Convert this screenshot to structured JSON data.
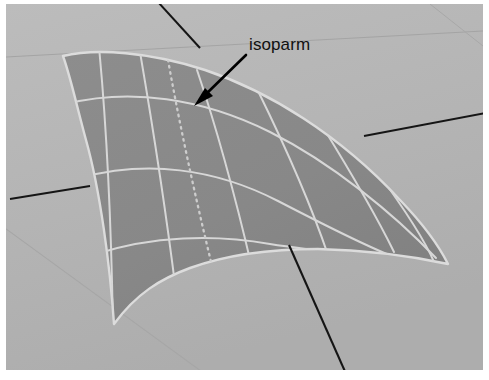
{
  "figure": {
    "kind": "3d-surface-viewport",
    "canvas": {
      "width": 489,
      "height": 380
    }
  },
  "colors": {
    "page_background": "#ffffff",
    "viewport_background": "#b5b5b5",
    "viewport_background_shade": "#aeaeae",
    "surface_fill": "#8a8a8a",
    "surface_fill_shade": "#828282",
    "surface_outline": "#d8d8d8",
    "isoparm_grid_line": "#d9d9d9",
    "isoparm_highlight_dotted": "#c9c9c9",
    "axis_line": "#141414",
    "ground_grid_line": "#a2a2a2",
    "annotation_text": "#111111",
    "annotation_arrow": "#000000"
  },
  "annotations": [
    {
      "id": "isoparm-callout",
      "label": "isoparm",
      "label_x": 249,
      "label_y": 36,
      "arrow_from": [
        246,
        55
      ],
      "arrow_to": [
        196,
        104
      ]
    }
  ],
  "viewport": {
    "background_rect": {
      "x": 6,
      "y": 4,
      "width": 477,
      "height": 366
    },
    "ground_grid_lines": [
      {
        "name": "ground-grid-horizontal",
        "x1": 6,
        "y1": 56,
        "x2": 483,
        "y2": 30
      },
      {
        "name": "ground-grid-diagonal-left",
        "x1": 6,
        "y1": 230,
        "x2": 200,
        "y2": 370
      }
    ],
    "axes": [
      {
        "name": "axis-vertical-blue",
        "points": "160,4 264,118 289,255 340,370",
        "visible_segments": [
          {
            "x1": 160,
            "y1": 4,
            "x2": 196,
            "y2": 44
          },
          {
            "x1": 291,
            "y1": 247,
            "x2": 344,
            "y2": 370
          }
        ]
      },
      {
        "name": "axis-horizontal-right",
        "visible_segments": [
          {
            "x1": 366,
            "y1": 135,
            "x2": 483,
            "y2": 113
          }
        ]
      },
      {
        "name": "axis-horizontal-left",
        "visible_segments": [
          {
            "x1": 12,
            "y1": 198,
            "x2": 88,
            "y2": 186
          }
        ]
      }
    ]
  },
  "surface": {
    "name": "nurbs-surface-patch",
    "outline_path": "M 63,56 C 96,48 150,52 205,70 C 268,91 340,135 400,200 C 425,226 440,248 448,264 C 420,258 370,250 318,249 C 270,249 226,255 190,268 C 160,279 136,294 114,324 C 110,265 100,190 86,140 C 76,103 70,75 63,56 Z",
    "u_isoparms": [
      {
        "name": "u-iso-1",
        "path": "M 100,50 C 106,110 112,200 114,324"
      },
      {
        "name": "u-iso-2",
        "path": "M 140,53 C 152,120 166,210 175,285"
      },
      {
        "name": "u-iso-3",
        "path": "M 196,71 C 216,130 236,205 250,262"
      },
      {
        "name": "u-iso-4",
        "path": "M 258,94 C 284,146 310,205 326,249"
      },
      {
        "name": "u-iso-5",
        "path": "M 320,125 C 349,170 376,215 392,246"
      },
      {
        "name": "u-iso-6",
        "path": "M 375,171 C 398,202 422,236 432,256"
      }
    ],
    "v_isoparms": [
      {
        "name": "v-iso-1",
        "path": "M 72,110 C 130,92 200,100 268,133 C 330,163 392,214 432,256"
      },
      {
        "name": "v-iso-2",
        "path": "M 84,180 C 146,162 212,170 276,202 C 334,231 386,256 420,264"
      },
      {
        "name": "v-iso-3",
        "path": "M 100,256 C 154,238 214,236 268,245 C 312,251 362,254 400,258"
      }
    ],
    "highlighted_isoparm": {
      "name": "highlighted-isoparm-dotted",
      "style": "dotted",
      "path": "M 168,55 C 178,112 196,196 216,282"
    }
  }
}
